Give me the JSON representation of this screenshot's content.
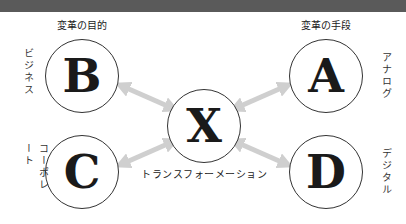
{
  "banner": {
    "text_visible": false
  },
  "headers": {
    "left": "変革の目的",
    "right": "変革の手段"
  },
  "nodes": {
    "B": {
      "letter": "B",
      "label": "ビジネス"
    },
    "C": {
      "letter": "C",
      "label": "コーポレート"
    },
    "X": {
      "letter": "X",
      "caption": "トランスフォーメーション"
    },
    "A": {
      "letter": "A",
      "label": "アナログ"
    },
    "D": {
      "letter": "D",
      "label": "デジタル"
    }
  },
  "colors": {
    "arrow": "#cfcfcf",
    "circle_border": "#333333",
    "banner": "#5a5a5a"
  },
  "arrows": [
    {
      "from": "X",
      "to": "B",
      "type": "double-headed"
    },
    {
      "from": "X",
      "to": "C",
      "type": "double-headed"
    },
    {
      "from": "X",
      "to": "A",
      "type": "double-headed"
    },
    {
      "from": "X",
      "to": "D",
      "type": "double-headed"
    }
  ]
}
